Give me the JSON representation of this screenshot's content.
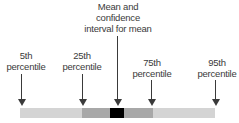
{
  "diagram": {
    "labels": {
      "p5": [
        "5th",
        "percentile"
      ],
      "p25": [
        "25th",
        "percentile"
      ],
      "mean": [
        "Mean and",
        "confidence",
        "interval for mean"
      ],
      "p75": [
        "75th",
        "percentile"
      ],
      "p95": [
        "95th",
        "percentile"
      ]
    },
    "colors": {
      "outer_range": "#d4d4d4",
      "interquartile": "#a8a8a8",
      "mean_ci": "#000000",
      "arrow": "#3a3a3a"
    }
  }
}
